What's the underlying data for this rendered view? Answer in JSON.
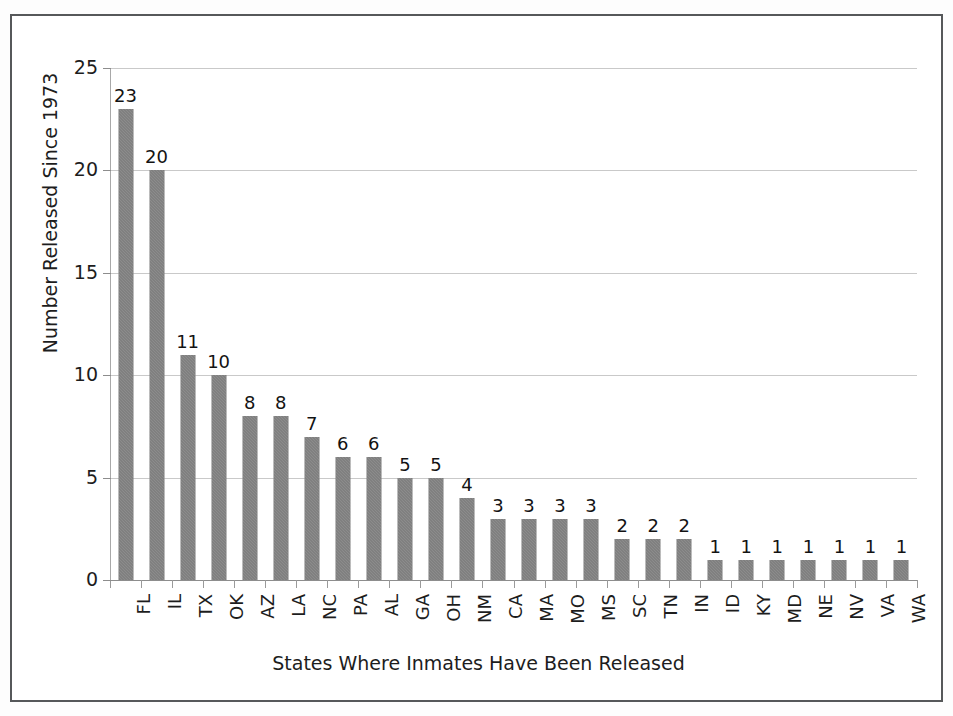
{
  "chart_data": {
    "type": "bar",
    "title": "",
    "xlabel": "States Where Inmates Have Been Released",
    "ylabel": "Number Released Since 1973",
    "ylim": [
      0,
      25
    ],
    "yticks": [
      0,
      5,
      10,
      15,
      20,
      25
    ],
    "grid": true,
    "legend": false,
    "bar_color": "#737373",
    "gridline_color": "#c9c9c9",
    "axis_color": "#8d8d8d",
    "value_labels": true,
    "categories": [
      "FL",
      "IL",
      "TX",
      "OK",
      "AZ",
      "LA",
      "NC",
      "PA",
      "AL",
      "GA",
      "OH",
      "NM",
      "CA",
      "MA",
      "MO",
      "MS",
      "SC",
      "TN",
      "IN",
      "ID",
      "KY",
      "MD",
      "NE",
      "NV",
      "VA",
      "WA"
    ],
    "values": [
      23,
      20,
      11,
      10,
      8,
      8,
      7,
      6,
      6,
      5,
      5,
      4,
      3,
      3,
      3,
      3,
      2,
      2,
      2,
      1,
      1,
      1,
      1,
      1,
      1,
      1
    ]
  },
  "figure": {
    "border_color": "#56585a",
    "background": "#ffffff"
  }
}
